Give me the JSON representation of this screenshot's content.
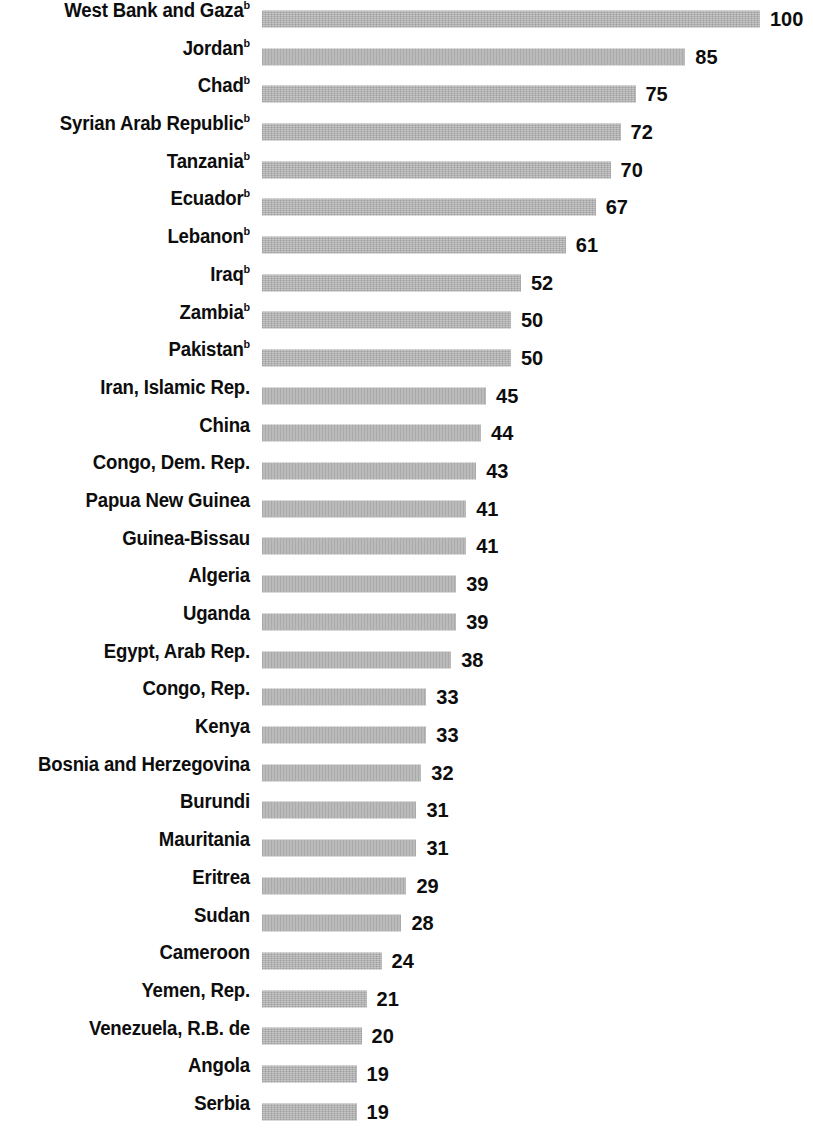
{
  "chart": {
    "type": "bar",
    "orientation": "horizontal",
    "bar_color": "#b0b0b0",
    "text_color": "#0d0d0d",
    "background": "#ffffff",
    "footnote_marker": "b"
  },
  "chart_data": {
    "type": "bar",
    "title": "",
    "subtitle": "",
    "xlabel": "",
    "ylabel": "",
    "xlim": [
      0,
      100
    ],
    "grid": false,
    "legend": null,
    "orientation": "horizontal",
    "axis_visible": false,
    "value_labels": true,
    "categories": [
      "West Bank and Gaza",
      "Jordan",
      "Chad",
      "Syrian Arab Republic",
      "Tanzania",
      "Ecuador",
      "Lebanon",
      "Iraq",
      "Zambia",
      "Pakistan",
      "Iran, Islamic Rep.",
      "China",
      "Congo, Dem. Rep.",
      "Papua New Guinea",
      "Guinea-Bissau",
      "Algeria",
      "Uganda",
      "Egypt, Arab Rep.",
      "Congo, Rep.",
      "Kenya",
      "Bosnia and Herzegovina",
      "Burundi",
      "Mauritania",
      "Eritrea",
      "Sudan",
      "Cameroon",
      "Yemen, Rep.",
      "Venezuela, R.B. de",
      "Angola",
      "Serbia"
    ],
    "values": [
      100,
      85,
      75,
      72,
      70,
      67,
      61,
      52,
      50,
      50,
      45,
      44,
      43,
      41,
      41,
      39,
      39,
      38,
      33,
      33,
      32,
      31,
      31,
      29,
      28,
      24,
      21,
      20,
      19,
      19
    ]
  },
  "rows": [
    {
      "label": "West Bank and Gaza",
      "marker": "b",
      "value": "100",
      "amount": 100
    },
    {
      "label": "Jordan",
      "marker": "b",
      "value": "85",
      "amount": 85
    },
    {
      "label": "Chad",
      "marker": "b",
      "value": "75",
      "amount": 75
    },
    {
      "label": "Syrian Arab Republic",
      "marker": "b",
      "value": "72",
      "amount": 72
    },
    {
      "label": "Tanzania",
      "marker": "b",
      "value": "70",
      "amount": 70
    },
    {
      "label": "Ecuador",
      "marker": "b",
      "value": "67",
      "amount": 67
    },
    {
      "label": "Lebanon",
      "marker": "b",
      "value": "61",
      "amount": 61
    },
    {
      "label": "Iraq",
      "marker": "b",
      "value": "52",
      "amount": 52
    },
    {
      "label": "Zambia",
      "marker": "b",
      "value": "50",
      "amount": 50
    },
    {
      "label": "Pakistan",
      "marker": "b",
      "value": "50",
      "amount": 50
    },
    {
      "label": "Iran, Islamic Rep.",
      "marker": "",
      "value": "45",
      "amount": 45
    },
    {
      "label": "China",
      "marker": "",
      "value": "44",
      "amount": 44
    },
    {
      "label": "Congo, Dem. Rep.",
      "marker": "",
      "value": "43",
      "amount": 43
    },
    {
      "label": "Papua New Guinea",
      "marker": "",
      "value": "41",
      "amount": 41
    },
    {
      "label": "Guinea-Bissau",
      "marker": "",
      "value": "41",
      "amount": 41
    },
    {
      "label": "Algeria",
      "marker": "",
      "value": "39",
      "amount": 39
    },
    {
      "label": "Uganda",
      "marker": "",
      "value": "39",
      "amount": 39
    },
    {
      "label": "Egypt, Arab Rep.",
      "marker": "",
      "value": "38",
      "amount": 38
    },
    {
      "label": "Congo, Rep.",
      "marker": "",
      "value": "33",
      "amount": 33
    },
    {
      "label": "Kenya",
      "marker": "",
      "value": "33",
      "amount": 33
    },
    {
      "label": "Bosnia and Herzegovina",
      "marker": "",
      "value": "32",
      "amount": 32
    },
    {
      "label": "Burundi",
      "marker": "",
      "value": "31",
      "amount": 31
    },
    {
      "label": "Mauritania",
      "marker": "",
      "value": "31",
      "amount": 31
    },
    {
      "label": "Eritrea",
      "marker": "",
      "value": "29",
      "amount": 29
    },
    {
      "label": "Sudan",
      "marker": "",
      "value": "28",
      "amount": 28
    },
    {
      "label": "Cameroon",
      "marker": "",
      "value": "24",
      "amount": 24
    },
    {
      "label": "Yemen, Rep.",
      "marker": "",
      "value": "21",
      "amount": 21
    },
    {
      "label": "Venezuela, R.B. de",
      "marker": "",
      "value": "20",
      "amount": 20
    },
    {
      "label": "Angola",
      "marker": "",
      "value": "19",
      "amount": 19
    },
    {
      "label": "Serbia",
      "marker": "",
      "value": "19",
      "amount": 19
    }
  ]
}
